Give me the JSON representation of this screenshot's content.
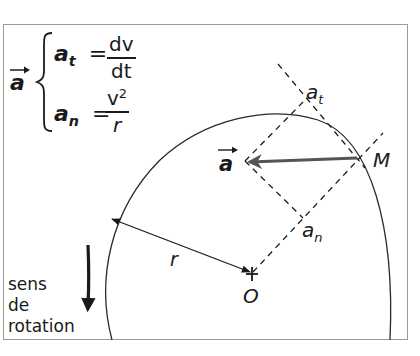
{
  "figure": {
    "type": "circular-motion acceleration diagram",
    "colors": {
      "frame": "#9a9a9a",
      "lines": "#1a1a1a",
      "acceleration_vector": "#555555"
    }
  },
  "formula_box": {
    "vector_label": "a",
    "tangential": {
      "lhs_base": "a",
      "lhs_sub": "t",
      "equals": "=",
      "numerator": "dv",
      "denominator": "dt"
    },
    "normal": {
      "lhs_base": "a",
      "lhs_sub": "n",
      "equals": "=",
      "numerator_base": "v",
      "numerator_sup": "2",
      "denominator": "r"
    }
  },
  "labels": {
    "point_M": "M",
    "point_O": "O",
    "radius": "r",
    "vector_a": "a",
    "component_t_base": "a",
    "component_t_sub": "t",
    "component_n_base": "a",
    "component_n_sub": "n"
  },
  "rotation_note": {
    "line1": "sens",
    "line2": "de",
    "line3": "rotation"
  }
}
